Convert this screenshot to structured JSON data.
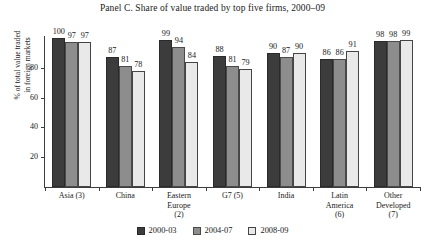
{
  "chart_data": {
    "type": "bar",
    "title": "Panel C. Share of value traded by top five firms, 2000–09",
    "xlabel": "",
    "ylabel_line1": "% of total value traded",
    "ylabel_line2": "in foreign markets",
    "ylim": [
      0,
      100
    ],
    "yticks": [
      20,
      40,
      60,
      80
    ],
    "grid": false,
    "legend_position": "bottom",
    "categories": [
      "Asia (3)",
      "China",
      "Eastern Europe (2)",
      "G7 (5)",
      "India",
      "Latin America (6)",
      "Other Developed (7)"
    ],
    "category_lines": [
      [
        "Asia (3)"
      ],
      [
        "China"
      ],
      [
        "Eastern",
        "Europe",
        "(2)"
      ],
      [
        "G7 (5)"
      ],
      [
        "India"
      ],
      [
        "Latin",
        "America",
        "(6)"
      ],
      [
        "Other",
        "Developed",
        "(7)"
      ]
    ],
    "series": [
      {
        "name": "2000-03",
        "color": "#3c3c3c",
        "values": [
          100,
          87,
          99,
          88,
          90,
          86,
          98
        ]
      },
      {
        "name": "2004-07",
        "color": "#8d8d8d",
        "values": [
          97,
          81,
          94,
          81,
          87,
          86,
          98
        ]
      },
      {
        "name": "2008-09",
        "color": "#e9e9e9",
        "values": [
          97,
          78,
          84,
          79,
          90,
          91,
          99
        ]
      }
    ]
  }
}
